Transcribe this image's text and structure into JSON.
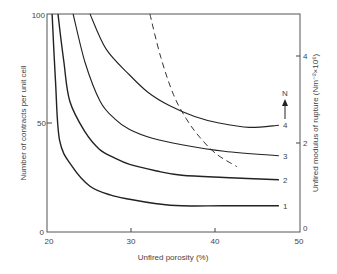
{
  "chart_data": {
    "type": "line",
    "title": "",
    "xlabel": "Unfired porosity (%)",
    "ylabel": "Number of contracts per unit cell",
    "y2label": "Unfired modulus of rupture (Nm⁻²×10⁶)",
    "xlim": [
      20,
      50
    ],
    "ylim": [
      0,
      100
    ],
    "y2lim": [
      0,
      5
    ],
    "xticks": [
      "20",
      "30",
      "40",
      "50"
    ],
    "yticks": [
      "0",
      "50",
      "100"
    ],
    "y2ticks": [
      "0",
      "2",
      "4"
    ],
    "grid": false,
    "annotation": "N",
    "series": [
      {
        "name": "1",
        "style": "solid",
        "x": [
          20.6,
          21.0,
          21.5,
          23.0,
          25.1,
          27.5,
          29.8,
          33.0,
          36.0,
          41.0,
          47.5
        ],
        "y": [
          100,
          70,
          42,
          30,
          21,
          17,
          15,
          13,
          12,
          12,
          12
        ]
      },
      {
        "name": "2",
        "style": "solid",
        "x": [
          21.3,
          22.0,
          22.7,
          24.5,
          26.2,
          28.0,
          29.8,
          33.0,
          36.0,
          41.0,
          47.5
        ],
        "y": [
          100,
          78,
          60,
          46,
          38,
          34,
          31,
          28,
          26,
          25,
          24
        ]
      },
      {
        "name": "3",
        "style": "solid",
        "x": [
          23.1,
          24.5,
          26.3,
          28.0,
          29.8,
          32.5,
          36.0,
          41.0,
          47.5
        ],
        "y": [
          100,
          78,
          60,
          52,
          47,
          43,
          40,
          37,
          35
        ]
      },
      {
        "name": "4",
        "style": "solid",
        "x": [
          25.1,
          27.0,
          29.8,
          32.0,
          34.5,
          37.5,
          40.4,
          44.0,
          47.5
        ],
        "y": [
          100,
          84,
          72,
          64,
          58,
          53,
          50,
          48,
          49
        ]
      },
      {
        "name": "modulus of rupture",
        "style": "dashed",
        "axis": "right",
        "x": [
          32.2,
          33.5,
          35.0,
          36.5,
          38.0,
          40.0,
          42.5
        ],
        "y": [
          100,
          80,
          63,
          52,
          44,
          36,
          30
        ]
      }
    ]
  }
}
